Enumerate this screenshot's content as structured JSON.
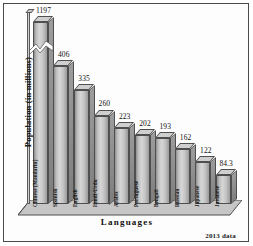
{
  "chart_data": {
    "type": "bar",
    "title": "",
    "subtitle": "",
    "xlabel": "Languages",
    "ylabel": "Population (in millions)",
    "categories": [
      "Chinese (Mandarin)",
      "Spanish",
      "English",
      "Hindi-Urdu",
      "Arabic",
      "Portuguese",
      "Bengali",
      "Russian",
      "Japanese",
      "Javanese"
    ],
    "values": [
      1197,
      406,
      335,
      260,
      223,
      202,
      193,
      162,
      122,
      84.3
    ],
    "value_labels": [
      "1197",
      "406",
      "335",
      "260",
      "223",
      "202",
      "193",
      "162",
      "122",
      "84.3"
    ],
    "ylim": [
      0,
      470
    ],
    "grid": false,
    "legend": null,
    "axis_break": {
      "present": true,
      "on_category": "Chinese (Mandarin)",
      "note": "zigzag break marker drawn across the first bar"
    },
    "annotation": "2013 data",
    "style": {
      "bar_fill": "#cfcfcf",
      "bar_outline": "#4f4f4f",
      "background": "#fdfdfd",
      "frame": "#4a4a4a",
      "text": "#111111",
      "three_d": true
    }
  }
}
